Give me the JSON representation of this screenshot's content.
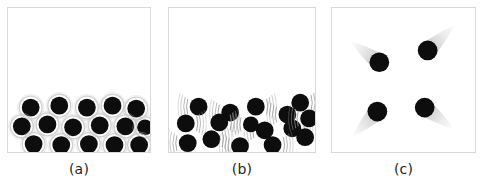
{
  "figure": {
    "background_color": "#ffffff",
    "particle_color": "#0d0d0d",
    "halo_color": "#c8c8c8",
    "border_color": "#d9d9d9",
    "trail_color": "#b5b5b5",
    "panel_count": 3
  },
  "panels": [
    {
      "id": "a",
      "caption": "(a)",
      "state": "solid",
      "particle_count": 16,
      "decoration": "vibration-halo-ring",
      "particles": [
        {
          "cx": 23,
          "cy": 101,
          "r": 9
        },
        {
          "cx": 52,
          "cy": 99,
          "r": 9
        },
        {
          "cx": 80,
          "cy": 101,
          "r": 9
        },
        {
          "cx": 106,
          "cy": 99,
          "r": 9
        },
        {
          "cx": 130,
          "cy": 102,
          "r": 9
        },
        {
          "cx": 14,
          "cy": 120,
          "r": 9
        },
        {
          "cx": 40,
          "cy": 118,
          "r": 9
        },
        {
          "cx": 66,
          "cy": 121,
          "r": 9
        },
        {
          "cx": 93,
          "cy": 119,
          "r": 9
        },
        {
          "cx": 119,
          "cy": 120,
          "r": 9
        },
        {
          "cx": 139,
          "cy": 121,
          "r": 8
        },
        {
          "cx": 26,
          "cy": 138,
          "r": 9
        },
        {
          "cx": 54,
          "cy": 139,
          "r": 9
        },
        {
          "cx": 82,
          "cy": 138,
          "r": 9
        },
        {
          "cx": 108,
          "cy": 139,
          "r": 9
        },
        {
          "cx": 133,
          "cy": 139,
          "r": 9
        }
      ]
    },
    {
      "id": "b",
      "caption": "(b)",
      "state": "liquid",
      "particle_count": 16,
      "decoration": "vibration-arcs",
      "particles": [
        {
          "cx": 30,
          "cy": 100,
          "r": 9,
          "arc": "left"
        },
        {
          "cx": 62,
          "cy": 106,
          "r": 9,
          "arc": "left"
        },
        {
          "cx": 88,
          "cy": 100,
          "r": 9,
          "arc": "right"
        },
        {
          "cx": 120,
          "cy": 108,
          "r": 9,
          "arc": "left"
        },
        {
          "cx": 133,
          "cy": 96,
          "r": 9,
          "arc": "right"
        },
        {
          "cx": 17,
          "cy": 117,
          "r": 9,
          "arc": "right"
        },
        {
          "cx": 51,
          "cy": 116,
          "r": 9,
          "arc": "right"
        },
        {
          "cx": 97,
          "cy": 124,
          "r": 9,
          "arc": "left"
        },
        {
          "cx": 125,
          "cy": 122,
          "r": 9,
          "arc": "right"
        },
        {
          "cx": 142,
          "cy": 112,
          "r": 9,
          "arc": "left"
        },
        {
          "cx": 19,
          "cy": 137,
          "r": 9,
          "arc": "left"
        },
        {
          "cx": 43,
          "cy": 133,
          "r": 9,
          "arc": "right"
        },
        {
          "cx": 72,
          "cy": 140,
          "r": 9,
          "arc": "left"
        },
        {
          "cx": 105,
          "cy": 139,
          "r": 9,
          "arc": "right"
        },
        {
          "cx": 138,
          "cy": 131,
          "r": 9,
          "arc": "right"
        },
        {
          "cx": 83,
          "cy": 118,
          "r": 8,
          "arc": "left"
        }
      ]
    },
    {
      "id": "c",
      "caption": "(c)",
      "state": "gas",
      "particle_count": 4,
      "decoration": "motion-blur-trails",
      "particles": [
        {
          "cx": 48,
          "cy": 55,
          "r": 10,
          "trail_dx": -30,
          "trail_dy": -22
        },
        {
          "cx": 97,
          "cy": 43,
          "r": 10,
          "trail_dx": 28,
          "trail_dy": -26
        },
        {
          "cx": 46,
          "cy": 105,
          "r": 10,
          "trail_dx": -26,
          "trail_dy": 26
        },
        {
          "cx": 94,
          "cy": 101,
          "r": 10,
          "trail_dx": 30,
          "trail_dy": 22
        }
      ]
    }
  ]
}
